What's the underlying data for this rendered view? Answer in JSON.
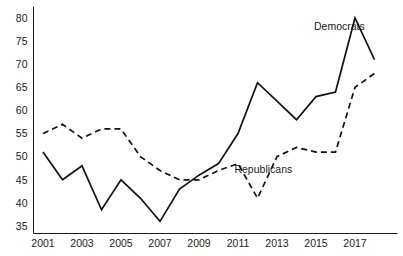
{
  "chart_data": {
    "type": "line",
    "title": "",
    "subtitle": "",
    "xlabel": "",
    "ylabel": "",
    "xlim": [
      2001,
      2018
    ],
    "ylim": [
      35,
      80
    ],
    "grid": false,
    "legend_position": "inline-annotation",
    "x": [
      2001,
      2002,
      2003,
      2004,
      2005,
      2006,
      2007,
      2008,
      2009,
      2010,
      2011,
      2012,
      2013,
      2014,
      2015,
      2016,
      2017,
      2018
    ],
    "xtick_labels": [
      "2001",
      "2003",
      "2005",
      "2007",
      "2009",
      "2011",
      "2013",
      "2015",
      "2017"
    ],
    "xtick_values": [
      2001,
      2003,
      2005,
      2007,
      2009,
      2011,
      2013,
      2015,
      2017
    ],
    "ytick_labels": [
      "35",
      "40",
      "45",
      "50",
      "55",
      "60",
      "65",
      "70",
      "75",
      "80"
    ],
    "ytick_values": [
      35,
      40,
      45,
      50,
      55,
      60,
      65,
      70,
      75,
      80
    ],
    "series": [
      {
        "name": "Democrats",
        "style": "solid",
        "color": "#111111",
        "label_x": 2016.2,
        "label_y": 77.5,
        "values": [
          51,
          45,
          48,
          38.5,
          45,
          41,
          36,
          43,
          46,
          48.5,
          55,
          66,
          62,
          58,
          63,
          64,
          80,
          71
        ]
      },
      {
        "name": "Republicans",
        "style": "dashed",
        "color": "#111111",
        "label_x": 2012.3,
        "label_y": 46.5,
        "values": [
          55,
          57,
          54,
          56,
          56,
          50,
          47,
          45,
          45,
          47,
          48.5,
          41,
          50,
          52,
          51,
          51,
          65,
          68
        ]
      }
    ]
  },
  "axes": {
    "y_axis_name": "y-axis",
    "x_axis_name": "x-axis"
  }
}
